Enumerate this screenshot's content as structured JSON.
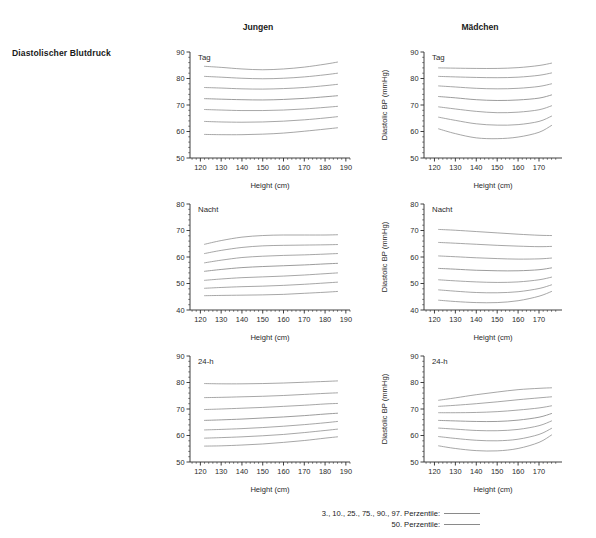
{
  "figure": {
    "row_label": "Diastolischer Blutdruck",
    "columns": [
      {
        "id": "jungen",
        "label": "Jungen"
      },
      {
        "id": "maedchen",
        "label": "Mädchen"
      }
    ],
    "legend": [
      {
        "label": "3., 10., 25., 75., 90., 97. Perzentile:",
        "style": "thin"
      },
      {
        "label": "50. Perzentile:",
        "style": "thick"
      }
    ],
    "line_color": "#8a8a8a",
    "axis_color": "#2b2b2b"
  },
  "chart_data": [
    {
      "id": "jungen-tag",
      "type": "line",
      "title": "Tag",
      "column": "Jungen",
      "xlabel": "Height (cm)",
      "ylabel": "",
      "xlim": [
        115,
        192
      ],
      "ylim": [
        50,
        90
      ],
      "xticks": [
        120,
        130,
        140,
        150,
        160,
        170,
        180,
        190
      ],
      "yticks": [
        50,
        60,
        70,
        80,
        90
      ],
      "grid": false,
      "x": [
        122,
        130,
        140,
        150,
        160,
        170,
        180,
        186
      ],
      "series": [
        {
          "name": "97. Perzentile",
          "values": [
            84.6,
            84.2,
            83.6,
            83.3,
            83.6,
            84.3,
            85.4,
            86.2
          ]
        },
        {
          "name": "90. Perzentile",
          "values": [
            80.8,
            80.5,
            80.1,
            79.9,
            80.1,
            80.6,
            81.4,
            82.0
          ]
        },
        {
          "name": "75. Perzentile",
          "values": [
            76.6,
            76.4,
            76.1,
            76.0,
            76.2,
            76.6,
            77.3,
            77.8
          ]
        },
        {
          "name": "50. Perzentile",
          "values": [
            72.4,
            72.2,
            72.0,
            71.9,
            72.1,
            72.5,
            73.1,
            73.5
          ]
        },
        {
          "name": "25. Perzentile",
          "values": [
            68.3,
            68.1,
            67.9,
            67.9,
            68.1,
            68.5,
            69.1,
            69.5
          ]
        },
        {
          "name": "10. Perzentile",
          "values": [
            63.8,
            63.6,
            63.5,
            63.6,
            63.9,
            64.4,
            65.1,
            65.6
          ]
        },
        {
          "name": "3. Perzentile",
          "values": [
            58.9,
            58.8,
            58.8,
            59.0,
            59.4,
            60.1,
            60.9,
            61.4
          ]
        }
      ]
    },
    {
      "id": "maedchen-tag",
      "type": "line",
      "title": "Tag",
      "column": "Mädchen",
      "xlabel": "Height (cm)",
      "ylabel": "Diastolic BP (mmHg)",
      "xlim": [
        115,
        181
      ],
      "ylim": [
        50,
        90
      ],
      "xticks": [
        120,
        130,
        140,
        150,
        160,
        170
      ],
      "yticks": [
        50,
        60,
        70,
        80,
        90
      ],
      "grid": false,
      "x": [
        122,
        130,
        140,
        150,
        160,
        170,
        176
      ],
      "series": [
        {
          "name": "97. Perzentile",
          "values": [
            84.0,
            83.9,
            83.8,
            83.8,
            84.1,
            84.9,
            85.8
          ]
        },
        {
          "name": "90. Perzentile",
          "values": [
            80.8,
            80.6,
            80.4,
            80.3,
            80.5,
            81.2,
            82.1
          ]
        },
        {
          "name": "75. Perzentile",
          "values": [
            77.2,
            76.8,
            76.3,
            76.1,
            76.3,
            77.0,
            78.0
          ]
        },
        {
          "name": "50. Perzentile",
          "values": [
            73.2,
            72.7,
            72.0,
            71.7,
            71.9,
            72.6,
            73.8
          ]
        },
        {
          "name": "25. Perzentile",
          "values": [
            69.3,
            68.5,
            67.6,
            67.1,
            67.3,
            68.2,
            69.7
          ]
        },
        {
          "name": "10. Perzentile",
          "values": [
            65.4,
            64.2,
            62.9,
            62.4,
            62.6,
            63.8,
            65.8
          ]
        },
        {
          "name": "3. Perzentile",
          "values": [
            61.0,
            59.2,
            57.6,
            57.3,
            57.9,
            59.7,
            62.3
          ]
        }
      ]
    },
    {
      "id": "jungen-nacht",
      "type": "line",
      "title": "Nacht",
      "column": "Jungen",
      "xlabel": "Height (cm)",
      "ylabel": "",
      "xlim": [
        115,
        192
      ],
      "ylim": [
        40,
        80
      ],
      "xticks": [
        120,
        130,
        140,
        150,
        160,
        170,
        180,
        190
      ],
      "yticks": [
        40,
        50,
        60,
        70,
        80
      ],
      "grid": false,
      "x": [
        122,
        130,
        140,
        150,
        160,
        170,
        180,
        186
      ],
      "series": [
        {
          "name": "97. Perzentile",
          "values": [
            64.8,
            66.2,
            67.5,
            68.1,
            68.3,
            68.3,
            68.3,
            68.4
          ]
        },
        {
          "name": "90. Perzentile",
          "values": [
            61.3,
            62.5,
            63.6,
            64.2,
            64.4,
            64.5,
            64.6,
            64.7
          ]
        },
        {
          "name": "75. Perzentile",
          "values": [
            57.8,
            58.8,
            59.8,
            60.3,
            60.6,
            60.8,
            61.1,
            61.3
          ]
        },
        {
          "name": "50. Perzentile",
          "values": [
            54.6,
            55.3,
            56.0,
            56.4,
            56.7,
            57.0,
            57.4,
            57.6
          ]
        },
        {
          "name": "25. Perzentile",
          "values": [
            51.2,
            51.7,
            52.2,
            52.5,
            52.8,
            53.2,
            53.7,
            54.0
          ]
        },
        {
          "name": "10. Perzentile",
          "values": [
            48.2,
            48.5,
            48.8,
            49.0,
            49.3,
            49.7,
            50.2,
            50.5
          ]
        },
        {
          "name": "3. Perzentile",
          "values": [
            45.4,
            45.5,
            45.6,
            45.7,
            45.9,
            46.3,
            46.7,
            47.0
          ]
        }
      ]
    },
    {
      "id": "maedchen-nacht",
      "type": "line",
      "title": "Nacht",
      "column": "Mädchen",
      "xlabel": "Height (cm)",
      "ylabel": "Diastolic BP (mmHg)",
      "xlim": [
        115,
        181
      ],
      "ylim": [
        40,
        80
      ],
      "xticks": [
        120,
        130,
        140,
        150,
        160,
        170
      ],
      "yticks": [
        40,
        50,
        60,
        70,
        80
      ],
      "grid": false,
      "x": [
        122,
        130,
        140,
        150,
        160,
        170,
        176
      ],
      "series": [
        {
          "name": "97. Perzentile",
          "values": [
            70.4,
            70.1,
            69.6,
            69.1,
            68.6,
            68.2,
            68.1
          ]
        },
        {
          "name": "90. Perzentile",
          "values": [
            65.5,
            65.2,
            64.8,
            64.4,
            64.1,
            63.9,
            64.0
          ]
        },
        {
          "name": "75. Perzentile",
          "values": [
            60.4,
            60.1,
            59.7,
            59.4,
            59.2,
            59.3,
            59.6
          ]
        },
        {
          "name": "50. Perzentile",
          "values": [
            55.7,
            55.4,
            55.0,
            54.8,
            54.8,
            55.2,
            55.9
          ]
        },
        {
          "name": "25. Perzentile",
          "values": [
            51.4,
            51.0,
            50.6,
            50.4,
            50.6,
            51.4,
            52.4
          ]
        },
        {
          "name": "10. Perzentile",
          "values": [
            47.6,
            47.1,
            46.6,
            46.5,
            46.9,
            48.1,
            49.5
          ]
        },
        {
          "name": "3. Perzentile",
          "values": [
            43.7,
            43.2,
            42.8,
            42.8,
            43.5,
            45.2,
            47.0
          ]
        }
      ]
    },
    {
      "id": "jungen-24h",
      "type": "line",
      "title": "24-h",
      "column": "Jungen",
      "xlabel": "Height (cm)",
      "ylabel": "",
      "xlim": [
        115,
        192
      ],
      "ylim": [
        50,
        90
      ],
      "xticks": [
        120,
        130,
        140,
        150,
        160,
        170,
        180,
        190
      ],
      "yticks": [
        50,
        60,
        70,
        80,
        90
      ],
      "grid": false,
      "x": [
        122,
        130,
        140,
        150,
        160,
        170,
        180,
        186
      ],
      "series": [
        {
          "name": "97. Perzentile",
          "values": [
            79.6,
            79.5,
            79.5,
            79.6,
            79.8,
            80.1,
            80.4,
            80.6
          ]
        },
        {
          "name": "90. Perzentile",
          "values": [
            74.3,
            74.4,
            74.6,
            74.8,
            75.1,
            75.5,
            75.9,
            76.1
          ]
        },
        {
          "name": "75. Perzentile",
          "values": [
            69.8,
            70.0,
            70.3,
            70.6,
            71.0,
            71.4,
            71.9,
            72.1
          ]
        },
        {
          "name": "50. Perzentile",
          "values": [
            65.7,
            65.9,
            66.2,
            66.6,
            67.0,
            67.5,
            68.1,
            68.4
          ]
        },
        {
          "name": "25. Perzentile",
          "values": [
            62.1,
            62.3,
            62.6,
            63.0,
            63.5,
            64.1,
            64.8,
            65.3
          ]
        },
        {
          "name": "10. Perzentile",
          "values": [
            59.0,
            59.2,
            59.5,
            59.9,
            60.4,
            61.1,
            61.9,
            62.4
          ]
        },
        {
          "name": "3. Perzentile",
          "values": [
            56.0,
            56.1,
            56.4,
            56.8,
            57.4,
            58.1,
            59.0,
            59.5
          ]
        }
      ]
    },
    {
      "id": "maedchen-24h",
      "type": "line",
      "title": "24-h",
      "column": "Mädchen",
      "xlabel": "Height (cm)",
      "ylabel": "Diastolic BP (mmHg)",
      "xlim": [
        115,
        181
      ],
      "ylim": [
        50,
        90
      ],
      "xticks": [
        120,
        130,
        140,
        150,
        160,
        170
      ],
      "yticks": [
        50,
        60,
        70,
        80,
        90
      ],
      "grid": false,
      "x": [
        122,
        130,
        140,
        150,
        160,
        170,
        176
      ],
      "series": [
        {
          "name": "97. Perzentile",
          "values": [
            73.3,
            74.2,
            75.4,
            76.4,
            77.3,
            77.8,
            78.0
          ]
        },
        {
          "name": "90. Perzentile",
          "values": [
            71.0,
            71.4,
            72.0,
            72.7,
            73.5,
            74.2,
            74.6
          ]
        },
        {
          "name": "75. Perzentile",
          "values": [
            68.6,
            68.6,
            68.7,
            69.0,
            69.6,
            70.4,
            71.2
          ]
        },
        {
          "name": "50. Perzentile",
          "values": [
            65.7,
            65.5,
            65.3,
            65.3,
            65.8,
            66.9,
            68.3
          ]
        },
        {
          "name": "25. Perzentile",
          "values": [
            62.8,
            62.4,
            61.9,
            61.8,
            62.3,
            63.7,
            65.5
          ]
        },
        {
          "name": "10. Perzentile",
          "values": [
            59.6,
            58.9,
            58.2,
            58.0,
            58.6,
            60.4,
            62.7
          ]
        },
        {
          "name": "3. Perzentile",
          "values": [
            56.1,
            55.1,
            54.3,
            54.2,
            55.1,
            57.4,
            60.2
          ]
        }
      ]
    }
  ]
}
